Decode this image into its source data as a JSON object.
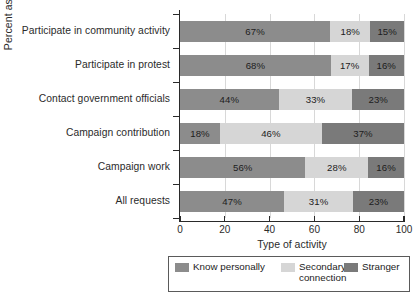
{
  "chart_data": {
    "type": "bar",
    "orientation": "horizontal",
    "stacked": true,
    "stacked_percent": true,
    "title": "",
    "xlabel": "Type of activity",
    "ylabel": "Percent asked",
    "xlim": [
      0,
      100
    ],
    "xticks": [
      0,
      20,
      40,
      60,
      80,
      100
    ],
    "xticklabels": [
      "0",
      "20",
      "40",
      "60",
      "80",
      "100"
    ],
    "grid": "vertical",
    "legend_position": "bottom",
    "categories": [
      "Participate in community activity",
      "Participate in protest",
      "Contact government officials",
      "Campaign contribution",
      "Campaign work",
      "All requests"
    ],
    "series": [
      {
        "name": "Know personally",
        "color": "#8c8c8c",
        "values": [
          67,
          68,
          44,
          18,
          56,
          47
        ],
        "labels": [
          "67%",
          "68%",
          "44%",
          "18%",
          "56%",
          "47%"
        ]
      },
      {
        "name": "Secondary connection",
        "color": "#d6d6d6",
        "values": [
          18,
          17,
          33,
          46,
          28,
          31
        ],
        "labels": [
          "18%",
          "17%",
          "33%",
          "46%",
          "28%",
          "31%"
        ]
      },
      {
        "name": "Stranger",
        "color": "#7a7a7a",
        "values": [
          15,
          16,
          23,
          37,
          16,
          23
        ],
        "labels": [
          "15%",
          "16%",
          "23%",
          "37%",
          "16%",
          "23%"
        ]
      }
    ],
    "legend_entries": [
      "Know personally",
      "Secondary\nconnection",
      "Stranger"
    ],
    "colors": {
      "know_personally": "#8c8c8c",
      "secondary_connection": "#d6d6d6",
      "stranger": "#7a7a7a",
      "gridline": "#d8d8d8",
      "axis": "#2a2a2a",
      "text": "#2b2b2b"
    }
  }
}
